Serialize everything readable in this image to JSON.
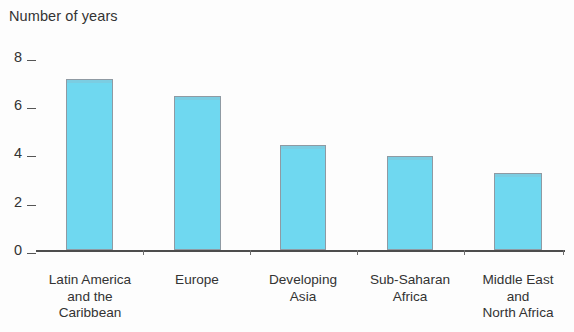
{
  "chart_data": {
    "type": "bar",
    "title": "Number of years",
    "xlabel": "",
    "ylabel": "Number of years",
    "categories": [
      "Latin America\nand the\nCaribbean",
      "Europe",
      "Developing\nAsia",
      "Sub-Saharan\nAfrica",
      "Middle East\nand\nNorth Africa"
    ],
    "values": [
      7.1,
      6.4,
      4.35,
      3.9,
      3.2
    ],
    "ylim": [
      0,
      8
    ],
    "yticks": [
      0,
      2,
      4,
      6,
      8
    ],
    "ytick_labels": [
      "0",
      "2",
      "4",
      "6",
      "8"
    ],
    "grid": false,
    "legend": null,
    "bar_color": "#6fd8f0",
    "bar_edge_color": "#8f9aa3",
    "axis_color": "#4d4d4d",
    "background_color": "#fdfdfd"
  },
  "axis": {
    "title": "Number of years",
    "ticks": [
      {
        "label": "8",
        "value": 8
      },
      {
        "label": "6",
        "value": 6
      },
      {
        "label": "4",
        "value": 4
      },
      {
        "label": "2",
        "value": 2
      },
      {
        "label": "0",
        "value": 0
      }
    ]
  },
  "bars": [
    {
      "label": "Latin America\nand the\nCaribbean",
      "value": 7.1
    },
    {
      "label": "Europe",
      "value": 6.4
    },
    {
      "label": "Developing\nAsia",
      "value": 4.35
    },
    {
      "label": "Sub-Saharan\nAfrica",
      "value": 3.9
    },
    {
      "label": "Middle East\nand\nNorth Africa",
      "value": 3.2
    }
  ]
}
